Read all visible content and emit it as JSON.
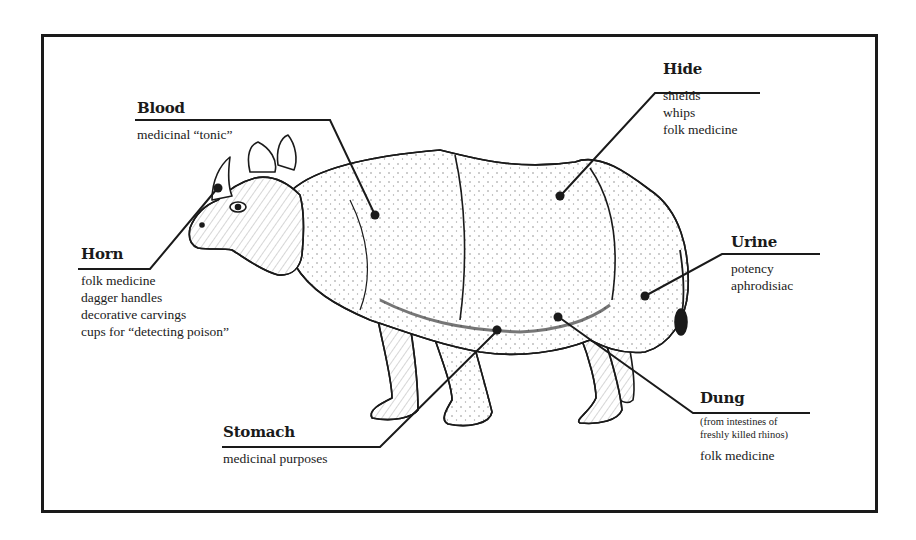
{
  "diagram": {
    "colors": {
      "ink": "#1a1a1a",
      "background": "#ffffff",
      "skin_shade": "#d9d4c8"
    },
    "callouts": [
      {
        "id": "blood",
        "title": "Blood",
        "note": "",
        "uses": [
          "medicinal “tonic”"
        ]
      },
      {
        "id": "hide",
        "title": "Hide",
        "note": "",
        "uses": [
          "shields",
          "whips",
          "folk medicine"
        ]
      },
      {
        "id": "horn",
        "title": "Horn",
        "note": "",
        "uses": [
          "folk medicine",
          "dagger handles",
          "decorative carvings",
          "cups for “detecting poison”"
        ]
      },
      {
        "id": "urine",
        "title": "Urine",
        "note": "",
        "uses": [
          "potency",
          "aphrodisiac"
        ]
      },
      {
        "id": "dung",
        "title": "Dung",
        "note_lines": [
          "(from intestines of",
          "freshly killed rhinos)"
        ],
        "uses": [
          "folk medicine"
        ]
      },
      {
        "id": "stomach",
        "title": "Stomach",
        "note": "",
        "uses": [
          "medicinal purposes"
        ]
      }
    ]
  }
}
